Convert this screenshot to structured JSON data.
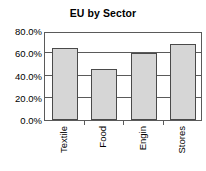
{
  "chart_data": {
    "type": "bar",
    "title": "EU by Sector",
    "xlabel": "",
    "ylabel": "",
    "categories": [
      "Textile",
      "Food",
      "Engin",
      "Stores"
    ],
    "values": [
      0.65,
      0.46,
      0.6,
      0.68
    ],
    "value_labels": [
      "65.0%",
      "46.0%",
      "60.0%",
      "68.0%"
    ],
    "ylim": [
      0,
      0.8
    ],
    "ytick_values": [
      0,
      0.2,
      0.4,
      0.6,
      0.8
    ],
    "ytick_labels": [
      "0.0%",
      "20.0%",
      "40.0%",
      "60.0%",
      "80.0%"
    ],
    "grid": true,
    "legend": false,
    "legend_position": "none",
    "series": [
      {
        "name": "EU",
        "values": [
          0.65,
          0.46,
          0.6,
          0.68
        ]
      }
    ],
    "colors": {
      "bar_fill": "#d6d6d6",
      "bar_border": "#4a4a4a",
      "axis": "#5a5a5a",
      "text": "#000000",
      "background": "#ffffff"
    }
  }
}
